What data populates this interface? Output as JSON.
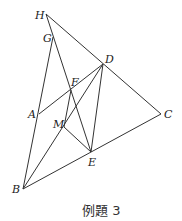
{
  "caption": "例題 3",
  "points": {
    "H": {
      "label": "H",
      "x": 46,
      "y": 14
    },
    "G": {
      "label": "G",
      "x": 53,
      "y": 37
    },
    "D": {
      "label": "D",
      "x": 103,
      "y": 64
    },
    "F": {
      "label": "F",
      "x": 71,
      "y": 90
    },
    "A": {
      "label": "A",
      "x": 39,
      "y": 114
    },
    "C": {
      "label": "C",
      "x": 161,
      "y": 114
    },
    "M": {
      "label": "M",
      "x": 64,
      "y": 127
    },
    "E": {
      "label": "E",
      "x": 91,
      "y": 152
    },
    "B": {
      "label": "B",
      "x": 23,
      "y": 189
    }
  },
  "segments": [
    [
      "H",
      "C"
    ],
    [
      "H",
      "E"
    ],
    [
      "G",
      "B"
    ],
    [
      "B",
      "C"
    ],
    [
      "B",
      "D"
    ],
    [
      "A",
      "D"
    ],
    [
      "D",
      "E"
    ],
    [
      "M",
      "E"
    ],
    [
      "F",
      "M"
    ]
  ],
  "line_color": "#333333"
}
